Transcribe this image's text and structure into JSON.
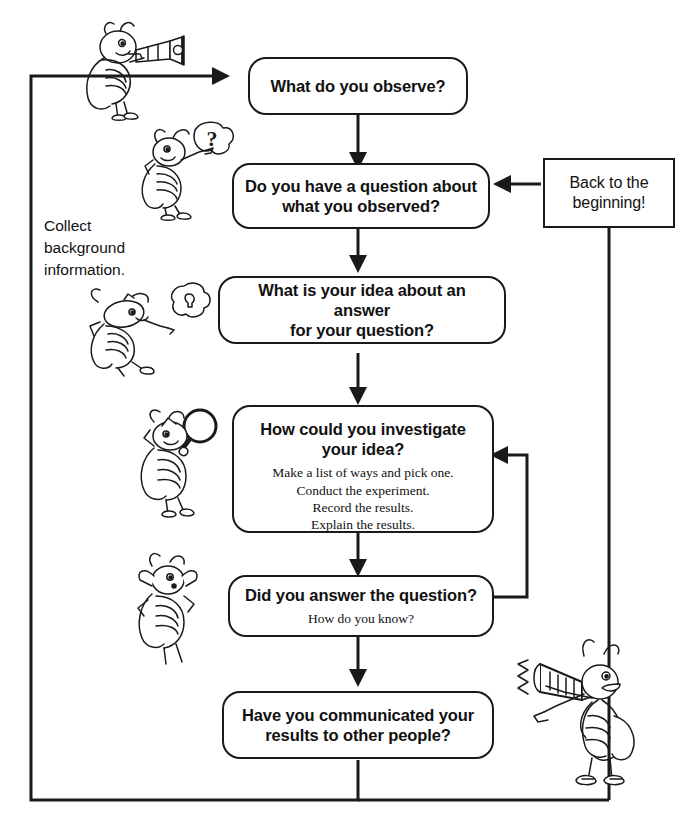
{
  "diagram": {
    "line_color": "#1a1a1a",
    "background": "#ffffff"
  },
  "nodes": [
    {
      "id": "observe",
      "title": "What do you observe?",
      "sub": "",
      "shape": "rounded"
    },
    {
      "id": "question",
      "title": "Do you have a question about\nwhat you observed?",
      "sub": "",
      "shape": "rounded"
    },
    {
      "id": "idea",
      "title": "What is your idea about an answer\nfor your question?",
      "sub": "",
      "shape": "rounded"
    },
    {
      "id": "investigate",
      "title": "How could you investigate\nyour idea?",
      "sub": "Make a list of ways and pick one.\nConduct the experiment.\nRecord the results.\nExplain the results.",
      "shape": "rounded"
    },
    {
      "id": "answered",
      "title": "Did you answer the question?",
      "sub": "How do you know?",
      "shape": "rounded"
    },
    {
      "id": "communicate",
      "title": "Have you communicated your\nresults to other people?",
      "sub": "",
      "shape": "rounded"
    },
    {
      "id": "back",
      "title": "Back to the\nbeginning!",
      "sub": "",
      "shape": "rectangle"
    }
  ],
  "notes": {
    "collect": "Collect\nbackground\ninformation."
  },
  "illustrations": [
    {
      "id": "bug-telescope",
      "name": "insect-with-telescope"
    },
    {
      "id": "bug-question",
      "name": "insect-with-question-mark"
    },
    {
      "id": "bug-idea",
      "name": "insect-with-idea-bubble"
    },
    {
      "id": "bug-magnifier",
      "name": "insect-with-magnifying-glass"
    },
    {
      "id": "bug-thinking",
      "name": "insect-thinking-pose"
    },
    {
      "id": "bug-megaphone",
      "name": "insect-with-megaphone"
    }
  ],
  "connectors": [
    {
      "id": "observe-to-question",
      "from": "observe",
      "to": "question",
      "kind": "arrow-down"
    },
    {
      "id": "question-to-idea",
      "from": "question",
      "to": "idea",
      "kind": "arrow-down"
    },
    {
      "id": "idea-to-investigate",
      "from": "idea",
      "to": "investigate",
      "kind": "arrow-down"
    },
    {
      "id": "investigate-to-answered",
      "from": "investigate",
      "to": "answered",
      "kind": "arrow-down"
    },
    {
      "id": "answered-to-communicate",
      "from": "answered",
      "to": "communicate",
      "kind": "arrow-down"
    },
    {
      "id": "answered-back-to-investigate",
      "from": "answered",
      "to": "investigate",
      "kind": "loop-right-arrow-left"
    },
    {
      "id": "back-to-question",
      "from": "back",
      "to": "question",
      "kind": "arrow-left"
    },
    {
      "id": "back-down-to-bottom-loop",
      "from": "back",
      "to": "bottom-loop",
      "kind": "line-down"
    },
    {
      "id": "communicate-to-observe",
      "from": "communicate",
      "to": "observe",
      "kind": "loop-bottom-left-arrow-right"
    }
  ]
}
